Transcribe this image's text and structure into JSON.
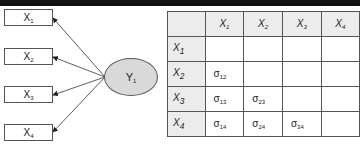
{
  "diagram": {
    "observed_variables": [
      {
        "label": "X",
        "sub": "1"
      },
      {
        "label": "X",
        "sub": "2"
      },
      {
        "label": "X",
        "sub": "3"
      },
      {
        "label": "X",
        "sub": "4"
      }
    ],
    "latent_variable": {
      "label": "Y",
      "sub": "1"
    },
    "colors": {
      "latent_fill": "#d9d9d9",
      "header_fill": "#ececec",
      "border": "#555555"
    }
  },
  "matrix": {
    "col_headers": [
      {
        "label": "X",
        "sub": "1"
      },
      {
        "label": "X",
        "sub": "2"
      },
      {
        "label": "X",
        "sub": "3"
      },
      {
        "label": "X",
        "sub": "4"
      }
    ],
    "rows": [
      {
        "label": "X",
        "sub": "1",
        "cells": [
          null,
          null,
          null,
          null
        ]
      },
      {
        "label": "X",
        "sub": "2",
        "cells": [
          {
            "s": "σ",
            "sub": "12"
          },
          null,
          null,
          null
        ]
      },
      {
        "label": "X",
        "sub": "3",
        "cells": [
          {
            "s": "σ",
            "sub": "13"
          },
          {
            "s": "σ",
            "sub": "23"
          },
          null,
          null
        ]
      },
      {
        "label": "X",
        "sub": "4",
        "cells": [
          {
            "s": "σ",
            "sub": "14"
          },
          {
            "s": "σ",
            "sub": "24"
          },
          {
            "s": "σ",
            "sub": "34"
          },
          null
        ]
      }
    ]
  }
}
